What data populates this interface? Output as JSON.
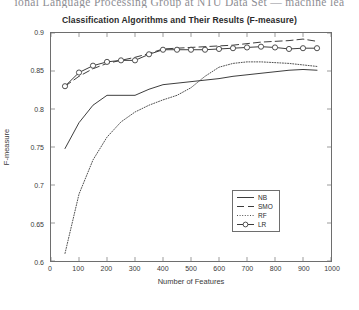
{
  "page_header": "ional Language Processing Group at NTU Data Set — machine lea",
  "figure": {
    "title": "Classification Algorithms and Their Results (F-measure)"
  },
  "axes": {
    "xlabel": "Number of Features",
    "ylabel": "F-measure",
    "xticks": [
      "0",
      "100",
      "200",
      "300",
      "400",
      "500",
      "600",
      "700",
      "800",
      "900",
      "1000"
    ],
    "yticks": [
      "0.6",
      "0.65",
      "0.7",
      "0.75",
      "0.8",
      "0.85",
      "0.9"
    ]
  },
  "legend": {
    "items": [
      {
        "label": "NB",
        "style": "solid",
        "marker": "none"
      },
      {
        "label": "SMO",
        "style": "dashed",
        "marker": "none"
      },
      {
        "label": "RF",
        "style": "dotted",
        "marker": "none"
      },
      {
        "label": "LR",
        "style": "solid",
        "marker": "circle"
      }
    ]
  },
  "colors": {
    "line": "#3c3c3c",
    "axis": "#6e6e6e",
    "text": "#2b2b2b",
    "background": "#ffffff"
  },
  "chart_data": {
    "type": "line",
    "title": "Classification Algorithms and Their Results (F-measure)",
    "xlabel": "Number of Features",
    "ylabel": "F-measure",
    "xlim": [
      0,
      1000
    ],
    "ylim": [
      0.6,
      0.9
    ],
    "xticks": [
      0,
      100,
      200,
      300,
      400,
      500,
      600,
      700,
      800,
      900,
      1000
    ],
    "yticks": [
      0.6,
      0.65,
      0.7,
      0.75,
      0.8,
      0.85,
      0.9
    ],
    "grid": false,
    "legend_position": "lower right",
    "x": [
      50,
      100,
      150,
      200,
      250,
      300,
      350,
      400,
      450,
      500,
      550,
      600,
      650,
      700,
      750,
      800,
      850,
      900,
      950
    ],
    "series": [
      {
        "name": "NB",
        "linestyle": "solid",
        "marker": "none",
        "values": [
          0.748,
          0.782,
          0.805,
          0.818,
          0.818,
          0.818,
          0.826,
          0.832,
          0.834,
          0.836,
          0.838,
          0.84,
          0.843,
          0.845,
          0.847,
          0.849,
          0.851,
          0.852,
          0.851
        ]
      },
      {
        "name": "SMO",
        "linestyle": "dashed",
        "marker": "none",
        "values": [
          0.83,
          0.843,
          0.853,
          0.86,
          0.864,
          0.868,
          0.873,
          0.879,
          0.88,
          0.881,
          0.882,
          0.883,
          0.884,
          0.886,
          0.888,
          0.889,
          0.89,
          0.892,
          0.889
        ]
      },
      {
        "name": "RF",
        "linestyle": "dotted",
        "marker": "none",
        "values": [
          0.61,
          0.688,
          0.733,
          0.763,
          0.783,
          0.796,
          0.805,
          0.812,
          0.818,
          0.828,
          0.843,
          0.855,
          0.86,
          0.862,
          0.862,
          0.861,
          0.86,
          0.858,
          0.856
        ]
      },
      {
        "name": "LR",
        "linestyle": "solid",
        "marker": "circle",
        "values": [
          0.83,
          0.848,
          0.857,
          0.862,
          0.864,
          0.864,
          0.872,
          0.878,
          0.878,
          0.878,
          0.878,
          0.879,
          0.88,
          0.881,
          0.882,
          0.881,
          0.879,
          0.88,
          0.88
        ]
      }
    ]
  }
}
